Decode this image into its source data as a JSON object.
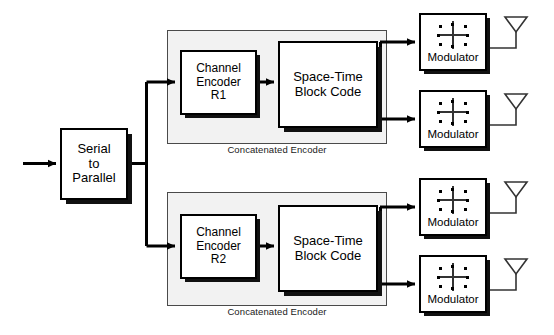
{
  "figure": {
    "type": "block-diagram",
    "background": "#ffffff",
    "line_color": "#000000",
    "group_fill": "#f2f2f2"
  },
  "input": {
    "name": "input-signal-arrow",
    "label": ""
  },
  "serial_to_parallel": {
    "line1": "Serial",
    "line2": "to",
    "line3": "Parallel"
  },
  "branches": [
    {
      "id": "upper",
      "group_caption": "Concatenated Encoder",
      "channel_encoder": {
        "line1": "Channel",
        "line2": "Encoder",
        "line3": "R1"
      },
      "stbc": {
        "line1": "Space-Time",
        "line2": "Block Code"
      },
      "modulators": [
        {
          "label": "Modulator",
          "icon": "constellation-icon",
          "antenna": "antenna-icon"
        },
        {
          "label": "Modulator",
          "icon": "constellation-icon",
          "antenna": "antenna-icon"
        }
      ]
    },
    {
      "id": "lower",
      "group_caption": "Concatenated Encoder",
      "channel_encoder": {
        "line1": "Channel",
        "line2": "Encoder",
        "line3": "R2"
      },
      "stbc": {
        "line1": "Space-Time",
        "line2": "Block Code"
      },
      "modulators": [
        {
          "label": "Modulator",
          "icon": "constellation-icon",
          "antenna": "antenna-icon"
        },
        {
          "label": "Modulator",
          "icon": "constellation-icon",
          "antenna": "antenna-icon"
        }
      ]
    }
  ],
  "constellation": {
    "name": "constellation-icon",
    "points": 8,
    "description": "8-point constellation dots around crossed I/Q axes"
  },
  "antenna": {
    "name": "antenna-icon",
    "description": "downward triangle on vertical stem"
  }
}
